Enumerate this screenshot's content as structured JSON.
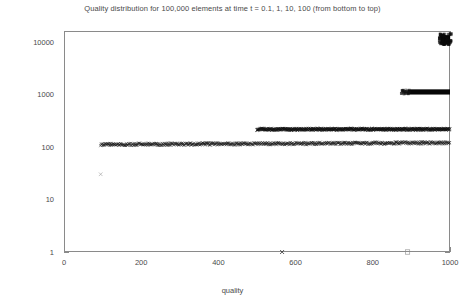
{
  "chart_data": {
    "type": "scatter",
    "title": "Quality distribution for 100,000 elements at time t = 0.1, 1, 10, 100 (from bottom to top)",
    "xlabel": "quality",
    "ylabel": "number",
    "xlim": [
      0,
      1000
    ],
    "ylim": [
      1,
      30000
    ],
    "yscale": "log",
    "xscale": "linear",
    "grid": false,
    "legend": false,
    "xticks": [
      "0",
      "200",
      "400",
      "600",
      "800",
      "1000"
    ],
    "xtick_values": [
      0,
      200,
      400,
      600,
      800,
      1000
    ],
    "yticks": [
      "1",
      "10",
      "100",
      "1000",
      "10000"
    ],
    "ytick_values": [
      1,
      10,
      100,
      1000,
      10000
    ],
    "series": [
      {
        "name": "t = 0.1",
        "marker": "x",
        "color": "#1a1a1a",
        "description": "Broad noisy band near number = 100-130 spanning quality 95 to 1000, plus an isolated outlier",
        "x_range": [
          95,
          1000
        ],
        "y_typical": 110,
        "points": [
          {
            "x": 95,
            "y": 30,
            "note": "isolated low outlier"
          }
        ]
      },
      {
        "name": "t = 1",
        "marker": "x",
        "color": "#1a1a1a",
        "description": "Dense noisy band near number = 200-230 spanning quality 500 to 1000",
        "x_range": [
          500,
          1000
        ],
        "y_typical": 215,
        "points": [
          {
            "x": 565,
            "y": 1,
            "note": "isolated x marker at number = 1"
          }
        ]
      },
      {
        "name": "t = 10",
        "marker": "square",
        "color": "#000000",
        "description": "Solid black bar near number = 1100 spanning quality 890 to 1000",
        "x_range": [
          890,
          1000
        ],
        "y_typical": 1100,
        "points": [
          {
            "x": 890,
            "y": 1,
            "note": "isolated open square at number = 1"
          }
        ]
      },
      {
        "name": "t = 100",
        "marker": "square",
        "color": "#000000",
        "description": "Dense black blob near number = 10000 at quality 975 to 1000",
        "x_range": [
          975,
          1000
        ],
        "y_typical": 11000,
        "points": []
      }
    ],
    "annotations": [
      {
        "text": "outlier",
        "x": 95,
        "y": 30
      },
      {
        "text": "outlier",
        "x": 565,
        "y": 1
      },
      {
        "text": "outlier",
        "x": 890,
        "y": 1
      }
    ]
  }
}
